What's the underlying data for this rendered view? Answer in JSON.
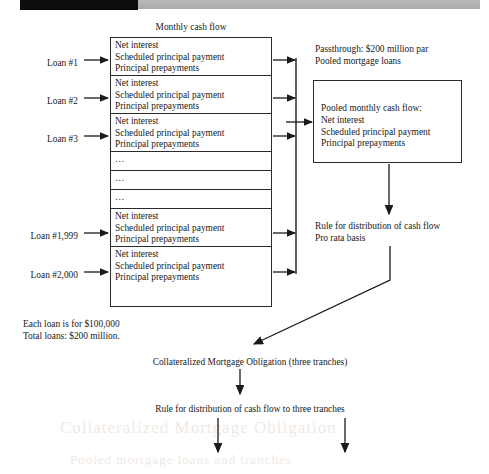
{
  "figure": {
    "title_top": "Monthly cash flow",
    "header_bar": {
      "black_color": "#0d0d0d",
      "gray_color": "#b0b0b0"
    }
  },
  "loan_labels": [
    {
      "id": "loan-1",
      "text": "Loan #1"
    },
    {
      "id": "loan-2",
      "text": "Loan #2"
    },
    {
      "id": "loan-3",
      "text": "Loan #3"
    },
    {
      "id": "loan-1999",
      "text": "Loan #1,999"
    },
    {
      "id": "loan-2000",
      "text": "Loan #2,000"
    }
  ],
  "cash_flow_lines": [
    "Net interest",
    "Scheduled principal payment",
    "Principal prepayments"
  ],
  "ellipsis": "…",
  "loan_rows": [
    {
      "kind": "loan",
      "lines": [
        "Net interest",
        "Scheduled principal payment",
        "Principal prepayments"
      ]
    },
    {
      "kind": "loan",
      "lines": [
        "Net interest",
        "Scheduled principal payment",
        "Principal prepayments"
      ]
    },
    {
      "kind": "loan",
      "lines": [
        "Net interest",
        "Scheduled principal payment",
        "Principal prepayments"
      ]
    },
    {
      "kind": "ellipsis",
      "lines": [
        "…"
      ]
    },
    {
      "kind": "ellipsis",
      "lines": [
        "…"
      ]
    },
    {
      "kind": "ellipsis",
      "lines": [
        "…"
      ]
    },
    {
      "kind": "loan",
      "lines": [
        "Net interest",
        "Scheduled principal payment",
        "Principal prepayments"
      ]
    },
    {
      "kind": "loan",
      "lines": [
        "Net interest",
        "Scheduled principal payment",
        "Principal prepayments"
      ]
    }
  ],
  "passthrough": {
    "line1": "Passthrough: $200 million par",
    "line2": "Pooled mortgage loans"
  },
  "pooled_box": {
    "line1": "Pooled monthly cash flow:",
    "line2": "Net interest",
    "line3": "Scheduled principal payment",
    "line4": "Principal prepayments"
  },
  "distribution_rule": {
    "line1": "Rule for distribution of cash flow",
    "line2": "Pro rata basis"
  },
  "loan_totals": {
    "line1": "Each loan is for $100,000",
    "line2": "Total loans: $200 million."
  },
  "cmo": {
    "label": "Collateralized Mortgage Obligation (three tranches)"
  },
  "tranche_rule": {
    "label": "Rule for distribution of cash flow to three tranches"
  },
  "ghost_text": {
    "line1": "Collateralized Mortgage Obligation",
    "line2": "Pooled mortgage loans and tranches"
  }
}
